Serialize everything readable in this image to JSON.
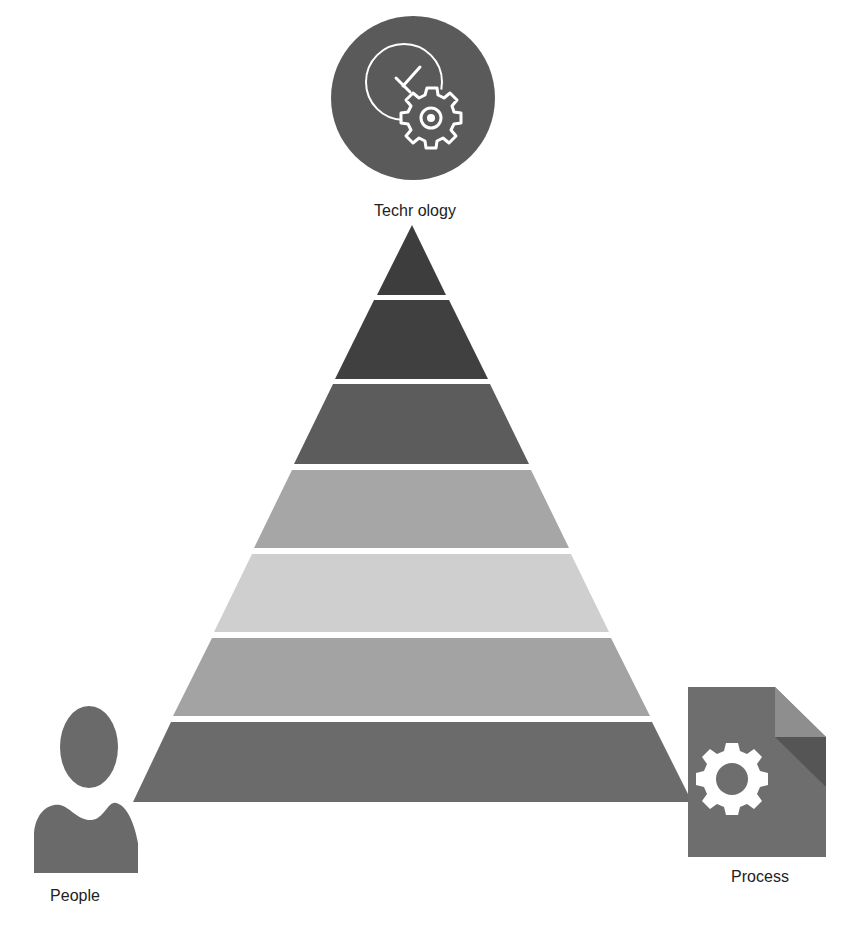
{
  "diagram": {
    "type": "pyramid",
    "layer_count": 7,
    "layers": [
      {
        "index": 1,
        "color": "#3d3d3d"
      },
      {
        "index": 2,
        "color": "#404040"
      },
      {
        "index": 3,
        "color": "#5c5c5c"
      },
      {
        "index": 4,
        "color": "#a6a6a6"
      },
      {
        "index": 5,
        "color": "#cfcfcf"
      },
      {
        "index": 6,
        "color": "#a3a3a3"
      },
      {
        "index": 7,
        "color": "#6b6b6b"
      }
    ]
  },
  "nodes": {
    "technology": {
      "label": "Techr ology",
      "icon": "clock-gear-icon",
      "color": "#5a5a5a"
    },
    "people": {
      "label": "People",
      "icon": "person-icon",
      "color": "#6a6a6a"
    },
    "process": {
      "label": "Process",
      "icon": "document-gear-icon",
      "color": "#6e6e6e"
    }
  }
}
